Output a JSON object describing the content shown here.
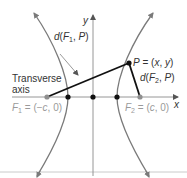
{
  "diagram": {
    "type": "hyperbola-definition",
    "axes": {
      "x_label": "x",
      "y_label": "y"
    },
    "labels": {
      "transverse_axis_line1": "Transverse",
      "transverse_axis_line2": "axis",
      "d_f1_p": "d(F1, P)",
      "d_f2_p": "d(F2, P)",
      "point_p": "P = (x, y)",
      "focus_1": "F1 = (−c, 0)",
      "focus_2": "F2 = (c, 0)"
    },
    "points": [
      {
        "name": "F1",
        "coords": "(−c, 0)"
      },
      {
        "name": "V1",
        "coords": "left vertex"
      },
      {
        "name": "O",
        "coords": "origin"
      },
      {
        "name": "V2",
        "coords": "right vertex"
      },
      {
        "name": "F2",
        "coords": "(c, 0)"
      },
      {
        "name": "P",
        "coords": "(x, y)"
      }
    ],
    "colors": {
      "curve": "#7a7a7a",
      "segments": "#111111",
      "axes": "#8a8a8a",
      "focus": "#8f8f8f"
    }
  }
}
